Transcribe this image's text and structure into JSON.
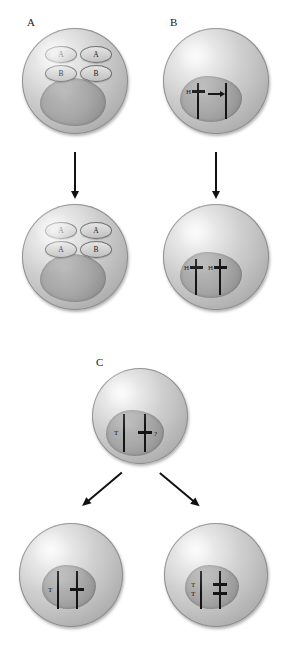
{
  "figure": {
    "panels": [
      {
        "id": "A",
        "label": "A",
        "top_cell": {
          "genes": [
            "A",
            "A",
            "B",
            "B"
          ]
        },
        "bottom_cell": {
          "genes": [
            "A",
            "A",
            "A",
            "B"
          ]
        }
      },
      {
        "id": "B",
        "label": "B",
        "top_cell": {
          "marks": [
            "H"
          ],
          "arrow": "transfer-arrow"
        },
        "bottom_cell": {
          "marks": [
            "H",
            "H"
          ]
        }
      },
      {
        "id": "C",
        "label": "C",
        "top_cell": {
          "marks": [
            "T"
          ],
          "unknown": "?"
        },
        "bottom_left_cell": {
          "marks": [
            "T"
          ]
        },
        "bottom_right_cell": {
          "marks": [
            "T",
            "T"
          ]
        }
      }
    ]
  },
  "colors": {
    "cell_fill": "#c4c4c4",
    "cell_rim": "#8e8e8e",
    "nucleus": "#a8a8a8",
    "mark": "#141414",
    "text": "#1a1a1a"
  }
}
